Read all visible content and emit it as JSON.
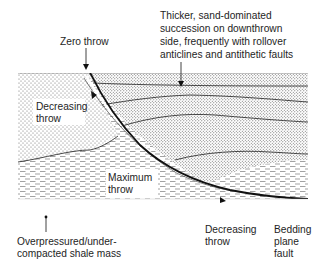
{
  "diagram": {
    "labels": {
      "zero_throw": "Zero throw",
      "thicker_succession": [
        "Thicker, sand-dominated",
        "succession on downthrown",
        "side, frequently with rollover",
        "anticlines and antithetic faults"
      ],
      "decreasing_throw_upper": [
        "Decreasing",
        "throw"
      ],
      "maximum_throw": [
        "Maximum",
        "throw"
      ],
      "decreasing_throw_lower": [
        "Decreasing",
        "throw"
      ],
      "bedding_plane_fault": [
        "Bedding",
        "plane",
        "fault"
      ],
      "shale_mass": [
        "Overpressured/under-",
        "compacted shale mass"
      ]
    },
    "legend_units": {
      "sand": "sand-dominated succession (stippled)",
      "shale": "overpressured shale (dashed)"
    },
    "colors": {
      "ink": "#1a1a1a",
      "stipple": "#6a6a6a",
      "shale_dash": "#8a8a8a",
      "paper": "#ffffff"
    }
  }
}
